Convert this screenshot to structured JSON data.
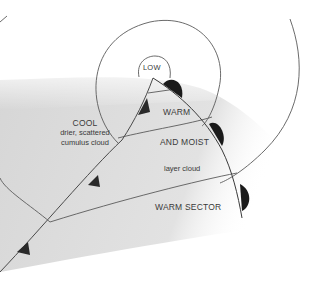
{
  "diagram": {
    "type": "weather-front-depression",
    "labels": {
      "low": "LOW",
      "cool_title": "COOL",
      "cool_line1": "drier, scattered",
      "cool_line2": "cumulus cloud",
      "warm": "WARM",
      "and_moist": "AND MOIST",
      "layer_cloud": "layer cloud",
      "warm_sector": "WARM SECTOR"
    },
    "fronts": [
      {
        "name": "cold-front",
        "symbol": "triangles",
        "count": 3
      },
      {
        "name": "warm-front",
        "symbol": "semicircles",
        "count": 3
      }
    ],
    "isobars": 3,
    "colors": {
      "background": "#ffffff",
      "shading": "#d8d8d8",
      "lines": "#555555",
      "symbols": "#1a1a1a",
      "text": "#3a3a3a"
    }
  }
}
